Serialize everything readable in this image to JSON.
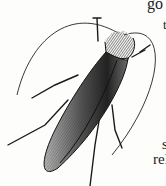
{
  "illustration": {
    "subject": "cockroach",
    "style": "black-and-white engraving",
    "colors": {
      "ink": "#1a1a1a",
      "paper": "#fdfdfc"
    }
  },
  "text_fragments": {
    "top": "go",
    "upper_right": "t",
    "middle_right": "s",
    "lower_right": "rel"
  }
}
